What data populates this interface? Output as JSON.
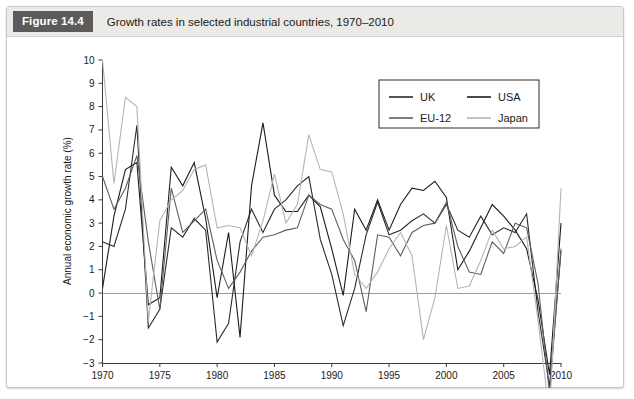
{
  "caption": {
    "figure_number": "Figure 14.4",
    "title": "Growth rates in selected industrial countries, 1970–2010"
  },
  "chart_data": {
    "type": "line",
    "title": "Growth rates in selected industrial countries, 1970–2010",
    "xlabel": "",
    "ylabel": "Annual economic growth rate (%)",
    "xlim": [
      1970,
      2010
    ],
    "ylim": [
      -3,
      10
    ],
    "xticks": [
      "1970",
      "1975",
      "1980",
      "1985",
      "1990",
      "1995",
      "2000",
      "2005",
      "2010"
    ],
    "yticks": [
      "10",
      "9",
      "8",
      "7",
      "6",
      "5",
      "4",
      "3",
      "2",
      "1",
      "0",
      "−1",
      "−2",
      "−3"
    ],
    "grid": false,
    "legend_position": "top-right",
    "x": [
      1970,
      1971,
      1972,
      1973,
      1974,
      1975,
      1976,
      1977,
      1978,
      1979,
      1980,
      1981,
      1982,
      1983,
      1984,
      1985,
      1986,
      1987,
      1988,
      1989,
      1990,
      1991,
      1992,
      1993,
      1994,
      1995,
      1996,
      1997,
      1998,
      1999,
      2000,
      2001,
      2002,
      2003,
      2004,
      2005,
      2006,
      2007,
      2008,
      2009,
      2010
    ],
    "series": [
      {
        "name": "UK",
        "color": "#2b2b2b",
        "values": [
          2.2,
          2.0,
          3.6,
          7.2,
          -1.5,
          -0.7,
          2.8,
          2.4,
          3.2,
          2.7,
          -2.1,
          -1.3,
          2.2,
          3.6,
          2.6,
          3.6,
          4.0,
          4.6,
          5.0,
          2.3,
          0.8,
          -1.4,
          0.2,
          2.5,
          3.9,
          2.5,
          2.7,
          3.1,
          3.4,
          3.0,
          3.8,
          2.7,
          2.4,
          3.3,
          2.5,
          2.8,
          2.6,
          3.4,
          -0.8,
          -4.0,
          1.8
        ]
      },
      {
        "name": "USA",
        "color": "#1c1c1c",
        "values": [
          0.2,
          3.3,
          5.3,
          5.6,
          -0.5,
          -0.2,
          5.4,
          4.6,
          5.6,
          3.2,
          -0.2,
          2.6,
          -1.9,
          4.6,
          7.3,
          4.2,
          3.5,
          3.5,
          4.2,
          3.7,
          1.9,
          -0.1,
          3.6,
          2.7,
          4.0,
          2.7,
          3.8,
          4.5,
          4.4,
          4.8,
          4.1,
          1.0,
          1.8,
          2.8,
          3.8,
          3.3,
          2.7,
          1.9,
          -0.3,
          -3.5,
          3.0
        ]
      },
      {
        "name": "EU-12",
        "color": "#5e5e5e",
        "values": [
          5.0,
          3.6,
          4.5,
          5.9,
          2.2,
          -0.7,
          4.5,
          2.6,
          3.1,
          3.6,
          1.4,
          0.2,
          0.9,
          1.8,
          2.4,
          2.5,
          2.7,
          2.8,
          4.2,
          3.8,
          3.6,
          2.3,
          1.4,
          -0.8,
          2.5,
          2.4,
          1.6,
          2.6,
          2.9,
          3.0,
          3.9,
          2.0,
          0.9,
          0.8,
          2.2,
          1.7,
          3.0,
          2.8,
          0.4,
          -4.3,
          1.9
        ]
      },
      {
        "name": "Japan",
        "color": "#b5b5b5",
        "values": [
          10.0,
          4.7,
          8.4,
          8.0,
          -1.2,
          3.1,
          4.0,
          4.4,
          5.3,
          5.5,
          2.8,
          2.9,
          2.8,
          1.6,
          3.1,
          5.1,
          3.0,
          3.8,
          6.8,
          5.3,
          5.2,
          3.4,
          0.8,
          0.2,
          0.9,
          1.9,
          2.6,
          1.6,
          -2.0,
          -0.2,
          2.9,
          0.2,
          0.3,
          1.4,
          2.7,
          1.9,
          2.0,
          2.4,
          -1.2,
          -5.2,
          4.5
        ]
      }
    ],
    "legend": [
      {
        "label": "UK",
        "color": "#2b2b2b"
      },
      {
        "label": "USA",
        "color": "#1c1c1c"
      },
      {
        "label": "EU-12",
        "color": "#5e5e5e"
      },
      {
        "label": "Japan",
        "color": "#b5b5b5"
      }
    ]
  }
}
